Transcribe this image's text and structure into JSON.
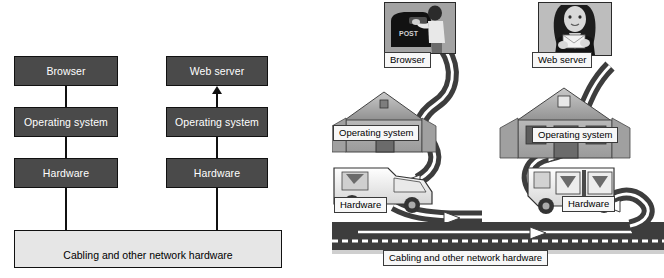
{
  "figure": {
    "colors": {
      "block_fill": "#4a4a4a",
      "block_text": "#ffffff",
      "cabling_fill": "#e6e6e6",
      "outline": "#111111",
      "caption_fill": "#f7f7f7",
      "road_dark": "#3d3d3d",
      "road_light": "#ffffff"
    }
  },
  "left_diagram": {
    "name": "layered-block-diagram",
    "client_stack": {
      "label": "client-side-stack",
      "layers": [
        {
          "label": "Browser"
        },
        {
          "label": "Operating system"
        },
        {
          "label": "Hardware"
        }
      ]
    },
    "server_stack": {
      "label": "server-side-stack",
      "layers": [
        {
          "label": "Web server"
        },
        {
          "label": "Operating system"
        },
        {
          "label": "Hardware"
        }
      ]
    },
    "network_bar": {
      "label": "Cabling and other network hardware"
    },
    "flow_direction": "client hardware -> cabling -> server hardware -> server OS -> web server"
  },
  "right_diagram": {
    "name": "postal-analogy-diagram",
    "client_column": {
      "photo_caption": "Browser",
      "photo_alt": "person-mailing-letter-at-mailbox",
      "mailbox_label": "POST",
      "house_caption": "Operating system",
      "truck_caption": "Hardware"
    },
    "server_column": {
      "photo_caption": "Web server",
      "photo_alt": "woman-holding-envelope",
      "house_caption": "Operating system",
      "truck_caption": "Hardware"
    },
    "road_caption": "Cabling and other network hardware"
  }
}
